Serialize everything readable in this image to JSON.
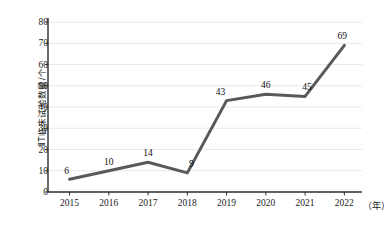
{
  "chart_data": {
    "type": "line",
    "title": "",
    "xlabel": "（年）",
    "ylabel": "ⅡT临床试验数量/个",
    "categories": [
      "2015",
      "2016",
      "2017",
      "2018",
      "2019",
      "2020",
      "2021",
      "2022"
    ],
    "values": [
      6,
      10,
      14,
      9,
      43,
      46,
      45,
      69
    ],
    "series": [
      {
        "name": "ⅡT临床试验数量",
        "values": [
          6,
          10,
          14,
          9,
          43,
          46,
          45,
          69
        ]
      }
    ],
    "point_labels": [
      "6",
      "10",
      "14",
      "9",
      "43",
      "46",
      "45",
      "69"
    ],
    "ylim": [
      0,
      80
    ],
    "ytick_labels": [
      "0",
      "10",
      "20",
      "30",
      "40",
      "50",
      "60",
      "70",
      "80"
    ],
    "ytick_values": [
      0,
      10,
      20,
      30,
      40,
      50,
      60,
      70,
      80
    ],
    "grid": true,
    "grid_axis": "y",
    "legend": false,
    "legend_position": "none",
    "line_color": "#595959",
    "grid_color": "#e8e8e8",
    "axis_color": "#2b2b2b",
    "background_color": "#ffffff",
    "line_width": 3,
    "markers": false
  }
}
